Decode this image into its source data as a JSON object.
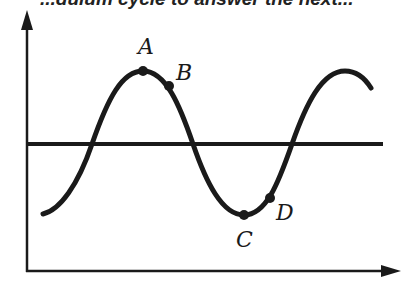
{
  "header": {
    "cut_text": "...dulum cycle to answer the next..."
  },
  "diagram": {
    "type": "wave",
    "points": [
      {
        "label": "A",
        "position": "crest (maximum displacement)"
      },
      {
        "label": "B",
        "position": "just past crest, descending"
      },
      {
        "label": "C",
        "position": "trough (minimum displacement)"
      },
      {
        "label": "D",
        "position": "just past trough, ascending"
      }
    ],
    "axes": {
      "x": "horizontal arrow",
      "y": "vertical arrow"
    },
    "colors": {
      "line": "#1a1a1a",
      "background": "#ffffff"
    }
  }
}
